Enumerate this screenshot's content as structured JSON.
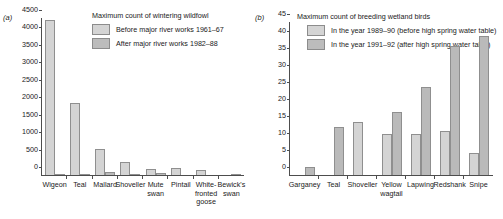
{
  "panel_a": {
    "tag": "(a)",
    "legend": {
      "title": "Maximum count of wintering wildfowl",
      "entries": [
        {
          "label": "Before major river works 1961–67",
          "color": "#d4d4d4"
        },
        {
          "label": "After major river works 1982–88",
          "color": "#bcbcbc"
        }
      ]
    },
    "chart_data": {
      "type": "bar",
      "title": "Maximum count of wintering wildfowl",
      "xlabel": "",
      "ylabel": "",
      "ylim": [
        0,
        4500
      ],
      "yticks": [
        0,
        500,
        1000,
        1500,
        2000,
        2500,
        3000,
        3500,
        4000,
        4500
      ],
      "ytick_labels": [
        "0",
        "500",
        "1000",
        "1500",
        "2000",
        "2500",
        "3000",
        "3500",
        "4000",
        "4500"
      ],
      "grid": false,
      "legend_position": "top-right",
      "categories": [
        "Wigeon",
        "Teal",
        "Mallard",
        "Shoveller",
        "Mute swan",
        "Pintail",
        "White-fronted goose",
        "Bewick's swan"
      ],
      "series": [
        {
          "name": "Before major river works 1961–67",
          "values": [
            4450,
            2050,
            750,
            380,
            180,
            190,
            130,
            0
          ]
        },
        {
          "name": "After major river works 1982–88",
          "values": [
            40,
            40,
            95,
            10,
            60,
            0,
            0,
            15
          ]
        }
      ]
    }
  },
  "panel_b": {
    "tag": "(b)",
    "legend": {
      "title": "Maximum count of breeding wetland birds",
      "entries": [
        {
          "label": "In the year 1989–90 (before high spring water table)",
          "color": "#d4d4d4"
        },
        {
          "label": "In the year 1991–92 (after high spring water table)",
          "color": "#bcbcbc"
        }
      ]
    },
    "chart_data": {
      "type": "bar",
      "title": "Maximum count of breeding wetland birds",
      "xlabel": "",
      "ylabel": "",
      "ylim": [
        0,
        45
      ],
      "yticks": [
        0,
        5,
        10,
        15,
        20,
        25,
        30,
        35,
        40,
        45
      ],
      "ytick_labels": [
        "0",
        "5",
        "10",
        "15",
        "20",
        "25",
        "30",
        "35",
        "40",
        "45"
      ],
      "grid": false,
      "legend_position": "top-right",
      "categories": [
        "Garganey",
        "Teal",
        "Shoveller",
        "Yellow wagtail",
        "Lapwing",
        "Redshank",
        "Snipe"
      ],
      "series": [
        {
          "name": "In the year 1989–90 (before high spring water table)",
          "values": [
            0,
            0,
            15.5,
            12,
            12,
            13,
            6.5
          ]
        },
        {
          "name": "In the year 1991–92 (after high spring water table)",
          "values": [
            2.5,
            14,
            0,
            18.5,
            26,
            38,
            41
          ]
        }
      ]
    }
  }
}
